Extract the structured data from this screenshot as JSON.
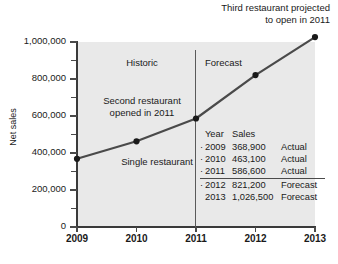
{
  "chart_data": {
    "type": "line",
    "title": "",
    "xlabel": "",
    "ylabel": "Net sales",
    "categories": [
      "2009",
      "2010",
      "2011",
      "2012",
      "2013"
    ],
    "x": [
      2009,
      2010,
      2011,
      2012,
      2013
    ],
    "values": [
      368900,
      463100,
      586600,
      821200,
      1026500
    ],
    "series": [
      {
        "name": "Net sales",
        "values": [
          368900,
          463100,
          586600,
          821200,
          1026500
        ]
      }
    ],
    "ylim": [
      0,
      1000000
    ],
    "xlim": [
      2009,
      2013
    ],
    "ytick_labels": [
      "0",
      "200,000",
      "400,000",
      "600,000",
      "800,000",
      "1,000,000"
    ],
    "ytick_values": [
      0,
      200000,
      400000,
      600000,
      800000,
      1000000
    ],
    "yminor_values": [
      100000,
      300000,
      500000,
      700000,
      900000
    ],
    "xtick_labels": [
      "2009",
      "2010",
      "2011",
      "2012",
      "2013"
    ],
    "grid": false,
    "legend": "none",
    "line_color": "#4a4a4a",
    "marker_color": "#1a1a1a",
    "panel_color": "#e9e9e9",
    "annotations": [
      {
        "text": "Third restaurant projected\nto open in 2011",
        "position": "top-right"
      },
      {
        "text": "Historic",
        "position": "plot-left-top"
      },
      {
        "text": "Forecast",
        "position": "plot-right-top"
      },
      {
        "text": "Second restaurant\nopened in 2011",
        "position": "plot-left-middle"
      },
      {
        "text": "Single restaurant",
        "position": "plot-left-lower"
      }
    ],
    "divider": {
      "at": "2011",
      "label_left": "Historic",
      "label_right": "Forecast"
    }
  },
  "notes": {
    "top": "Third restaurant projected\nto open in 2011",
    "historic": "Historic",
    "forecast": "Forecast",
    "second_restaurant": "Second restaurant\nopened in 2011",
    "single_restaurant": "Single restaurant"
  },
  "axes": {
    "ylabel": "Net sales",
    "yticks": [
      {
        "label": "1,000,000",
        "value": 1000000
      },
      {
        "label": "800,000",
        "value": 800000
      },
      {
        "label": "600,000",
        "value": 600000
      },
      {
        "label": "400,000",
        "value": 400000
      },
      {
        "label": "200,000",
        "value": 200000
      },
      {
        "label": "0",
        "value": 0
      }
    ],
    "xticks": [
      {
        "label": "2009"
      },
      {
        "label": "2010"
      },
      {
        "label": "2011"
      },
      {
        "label": "2012"
      },
      {
        "label": "2013"
      }
    ]
  },
  "table": {
    "headers": {
      "year": "Year",
      "sales": "Sales",
      "kind": ""
    },
    "rows": [
      {
        "bullet": "·",
        "year": "2009",
        "sales": "368,900",
        "kind": "Actual"
      },
      {
        "bullet": "·",
        "year": "2010",
        "sales": "463,100",
        "kind": "Actual"
      },
      {
        "bullet": "·",
        "year": "2011",
        "sales": "586,600",
        "kind": "Actual"
      },
      {
        "bullet": "·",
        "year": "2012",
        "sales": "821,200",
        "kind": "Forecast"
      },
      {
        "bullet": "",
        "year": "2013",
        "sales": "1,026,500",
        "kind": "Forecast"
      }
    ],
    "rule_after_row": 2
  }
}
